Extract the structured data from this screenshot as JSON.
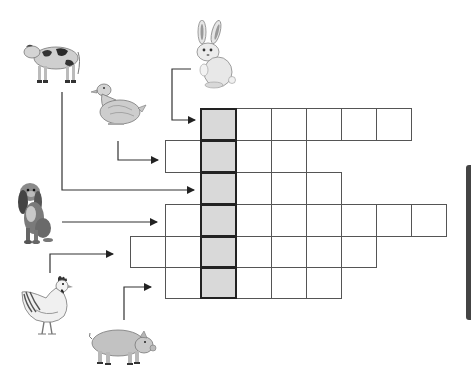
{
  "puzzle": {
    "type": "animal-crossword",
    "highlight_color": "#d9d9d9",
    "grid_line_color": "#555555",
    "highlight_border_color": "#222222",
    "cell_size": 35,
    "rows": [
      {
        "clue_animal": "rabbit",
        "start_col": 2,
        "length": 6,
        "shaded_col": 2,
        "letters": [
          "",
          "",
          "",
          "",
          "",
          ""
        ]
      },
      {
        "clue_animal": "duck",
        "start_col": 1,
        "length": 4,
        "shaded_col": 2,
        "letters": [
          "",
          "",
          "",
          ""
        ]
      },
      {
        "clue_animal": "cow",
        "start_col": 2,
        "length": 4,
        "shaded_col": 2,
        "letters": [
          "",
          "",
          "",
          ""
        ]
      },
      {
        "clue_animal": "dog",
        "start_col": 1,
        "length": 8,
        "shaded_col": 2,
        "letters": [
          "",
          "",
          "",
          "",
          "",
          "",
          "",
          ""
        ]
      },
      {
        "clue_animal": "hen",
        "start_col": 0,
        "length": 7,
        "shaded_col": 2,
        "letters": [
          "",
          "",
          "",
          "",
          "",
          "",
          ""
        ]
      },
      {
        "clue_animal": "pig",
        "start_col": 1,
        "length": 5,
        "shaded_col": 2,
        "letters": [
          "",
          "",
          "",
          "",
          ""
        ]
      }
    ]
  },
  "animals": [
    {
      "name": "cow",
      "icon": "cow-icon"
    },
    {
      "name": "rabbit",
      "icon": "rabbit-icon"
    },
    {
      "name": "duck",
      "icon": "duck-icon"
    },
    {
      "name": "dog",
      "icon": "dog-icon"
    },
    {
      "name": "hen",
      "icon": "hen-icon"
    },
    {
      "name": "pig",
      "icon": "pig-icon"
    }
  ]
}
